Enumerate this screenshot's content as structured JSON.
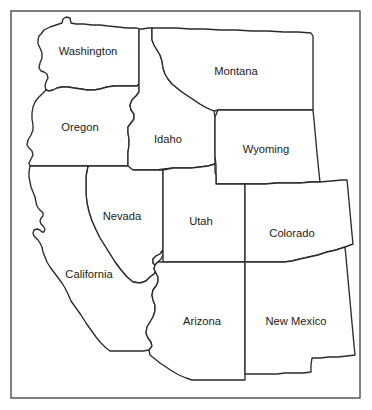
{
  "map": {
    "title": "Western United States outline map",
    "background_color": "#ffffff",
    "frame": {
      "name": "map-border-frame",
      "x": 11,
      "y": 11,
      "width": 349,
      "height": 387,
      "stroke_color": "#4a4a4a",
      "stroke_width": 1.4
    },
    "style": {
      "state_fill": "#ffffff",
      "state_stroke": "#2b2b2b",
      "state_stroke_width": 1.35,
      "label_color": "#1a1a1a",
      "label_font_size": 11.2
    },
    "states": [
      {
        "id": "washington",
        "label": "Washington",
        "label_x": 88,
        "label_y": 52,
        "path": "M 41 34 L 44 30 L 50 27 L 56 25 L 62 23 L 63 19 L 66 17 L 70 18 L 71 23 L 76 24 L 84 24 L 92 25 L 100 25 L 108 26 L 118 27 L 127 28 L 137 28 L 139 29 L 139 38 L 139 52 L 139 64 L 139 76 L 139 84 L 137 86 L 130 86 L 122 86 L 114 86 L 107 87 L 100 89 L 94 90 L 87 90 L 81 89 L 74 88 L 68 87 L 62 87 L 57 88 L 53 90 L 49 91 L 46 90 L 45 86 L 46 82 L 48 78 L 47 74 L 44 72 L 41 71 L 39 68 L 40 63 L 42 58 L 42 53 L 40 48 L 38 44 L 38 40 L 39 36 Z"
      },
      {
        "id": "oregon",
        "label": "Oregon",
        "label_x": 80,
        "label_y": 128,
        "path": "M 46 90 L 49 91 L 53 90 L 57 88 L 62 87 L 68 87 L 74 88 L 81 89 L 87 90 L 94 90 L 100 89 L 107 87 L 114 86 L 122 86 L 130 86 L 137 86 L 139 84 L 139 92 L 136 96 L 132 100 L 130 105 L 131 110 L 134 114 L 134 119 L 131 123 L 128 127 L 128 133 L 129 139 L 129 145 L 128 152 L 128 160 L 128 166 L 119 166 L 108 166 L 96 166 L 84 166 L 72 166 L 60 166 L 48 166 L 37 166 L 30 166 L 29 163 L 31 159 L 33 155 L 32 151 L 29 148 L 27 145 L 28 140 L 31 135 L 33 130 L 33 125 L 32 119 L 32 113 L 33 107 L 35 102 L 38 98 L 41 95 L 44 92 Z"
      },
      {
        "id": "idaho",
        "label": "Idaho",
        "label_x": 168,
        "label_y": 140,
        "path": "M 143 29 L 148 28 L 152 28 L 152 34 L 152 40 L 154 45 L 157 50 L 160 55 L 162 61 L 163 68 L 165 74 L 168 79 L 172 84 L 177 88 L 182 92 L 188 96 L 194 100 L 200 104 L 207 108 L 214 111 L 215 117 L 215 126 L 215 136 L 215 146 L 215 156 L 215 164 L 208 166 L 200 167 L 191 168 L 182 168 L 173 168 L 164 169 L 156 170 L 148 170 L 140 170 L 133 170 L 128 170 L 128 166 L 128 160 L 128 152 L 129 145 L 129 139 L 128 133 L 128 127 L 131 123 L 134 119 L 134 114 L 131 110 L 130 105 L 132 100 L 136 96 L 139 92 L 139 84 L 139 76 L 139 64 L 139 52 L 139 38 L 139 29 Z"
      },
      {
        "id": "montana",
        "label": "Montana",
        "label_x": 236,
        "label_y": 72,
        "path": "M 152 28 L 163 28 L 176 28 L 190 29 L 205 29 L 220 30 L 236 30 L 252 31 L 268 31 L 284 32 L 298 32 L 311 33 L 313 36 L 313 46 L 313 58 L 313 70 L 313 82 L 313 92 L 313 102 L 313 110 L 303 110 L 291 110 L 278 110 L 265 110 L 253 110 L 242 110 L 232 110 L 224 110 L 218 110 L 214 111 L 207 108 L 200 104 L 194 100 L 188 96 L 182 92 L 177 88 L 172 84 L 168 79 L 165 74 L 163 68 L 162 61 L 160 55 L 157 50 L 154 45 L 152 40 L 152 34 Z"
      },
      {
        "id": "wyoming",
        "label": "Wyoming",
        "label_x": 266,
        "label_y": 150,
        "path": "M 218 110 L 224 110 L 232 110 L 242 110 L 253 110 L 265 110 L 278 110 L 291 110 L 303 110 L 313 110 L 314 120 L 315 131 L 316 142 L 317 153 L 318 163 L 319 173 L 320 182 L 311 182 L 300 183 L 289 183 L 277 183 L 265 184 L 253 184 L 242 184 L 232 184 L 223 184 L 216 184 L 216 175 L 216 165 L 215 156 L 215 146 L 215 136 L 215 126 L 215 117 Z"
      },
      {
        "id": "nevada",
        "label": "Nevada",
        "label_x": 122,
        "label_y": 217,
        "path": "M 88 166 L 96 166 L 108 166 L 119 166 L 128 166 L 133 170 L 140 170 L 148 170 L 156 170 L 163 170 L 163 180 L 163 191 L 163 202 L 163 213 L 163 224 L 163 235 L 163 243 L 163 250 L 160 254 L 156 256 L 153 259 L 153 263 L 156 266 L 157 270 L 154 274 L 150 277 L 146 281 L 140 283 L 133 282 L 127 277 L 121 270 L 115 262 L 110 254 L 105 246 L 100 238 L 96 230 L 92 221 L 89 212 L 87 203 L 86 194 L 86 185 L 86 176 Z"
      },
      {
        "id": "california",
        "label": "California",
        "label_x": 89,
        "label_y": 275,
        "path": "M 30 166 L 37 166 L 48 166 L 60 166 L 72 166 L 84 166 L 88 166 L 86 176 L 86 185 L 86 194 L 87 203 L 89 212 L 92 221 L 96 230 L 100 238 L 105 246 L 110 254 L 115 262 L 121 270 L 127 277 L 133 282 L 140 283 L 146 281 L 150 277 L 154 274 L 157 270 L 156 266 L 153 263 L 153 259 L 156 256 L 160 254 L 163 250 L 163 255 L 161 259 L 158 262 L 155 265 L 154 269 L 156 273 L 158 277 L 158 282 L 156 286 L 153 290 L 152 295 L 153 300 L 155 305 L 155 311 L 153 317 L 150 322 L 147 327 L 146 333 L 148 338 L 151 342 L 152 346 L 149 350 L 143 351 L 135 351 L 126 351 L 117 351 L 110 351 L 106 348 L 101 343 L 96 337 L 91 330 L 86 323 L 81 315 L 76 308 L 71 301 L 68 294 L 65 288 L 62 283 L 59 279 L 56 275 L 53 271 L 50 267 L 47 262 L 45 257 L 43 252 L 42 247 L 40 243 L 38 240 L 36 238 L 34 236 L 33 233 L 34 230 L 37 229 L 40 230 L 42 232 L 44 232 L 45 229 L 43 226 L 41 224 L 40 221 L 41 218 L 43 216 L 43 213 L 41 211 L 39 209 L 37 206 L 36 202 L 35 197 L 33 192 L 31 187 L 30 182 L 29 177 L 29 172 Z"
      },
      {
        "id": "utah",
        "label": "Utah",
        "label_x": 201,
        "label_y": 222,
        "path": "M 163 170 L 173 168 L 182 168 L 191 168 L 200 167 L 208 166 L 215 164 L 215 172 L 216 175 L 216 184 L 223 184 L 232 184 L 242 184 L 245 184 L 245 195 L 245 206 L 245 217 L 245 228 L 245 239 L 245 250 L 245 262 L 235 262 L 224 262 L 213 262 L 202 262 L 191 262 L 180 262 L 171 262 L 163 262 L 163 253 L 163 243 L 163 235 L 163 224 L 163 213 L 163 202 L 163 191 L 163 180 Z"
      },
      {
        "id": "colorado",
        "label": "Colorado",
        "label_x": 292,
        "label_y": 234,
        "path": "M 245 184 L 253 184 L 265 184 L 277 183 L 289 183 L 300 183 L 311 182 L 320 182 L 331 181 L 342 180 L 347 180 L 348 190 L 349 201 L 350 212 L 351 223 L 352 234 L 353 244 L 345 247 L 336 250 L 327 252 L 318 255 L 309 257 L 300 259 L 292 261 L 284 262 L 275 262 L 266 262 L 257 262 L 250 262 L 245 262 L 245 250 L 245 239 L 245 228 L 245 217 L 245 206 L 245 195 Z"
      },
      {
        "id": "arizona",
        "label": "Arizona",
        "label_x": 202,
        "label_y": 322,
        "path": "M 163 262 L 171 262 L 180 262 L 191 262 L 202 262 L 213 262 L 224 262 L 235 262 L 245 262 L 245 273 L 245 285 L 245 297 L 245 309 L 245 321 L 245 333 L 245 345 L 245 357 L 245 369 L 245 380 L 236 380 L 226 380 L 216 380 L 207 380 L 199 380 L 192 380 L 186 378 L 179 375 L 172 371 L 166 367 L 160 363 L 155 359 L 150 355 L 149 350 L 152 346 L 151 342 L 148 338 L 146 333 L 147 327 L 150 322 L 153 317 L 155 311 L 155 305 L 153 300 L 152 295 L 153 290 L 156 286 L 158 282 L 158 277 L 156 273 L 154 269 L 155 265 L 158 262 Z"
      },
      {
        "id": "new-mexico",
        "label": "New Mexico",
        "label_x": 296,
        "label_y": 322,
        "path": "M 245 262 L 250 262 L 257 262 L 266 262 L 275 262 L 284 262 L 292 261 L 300 259 L 309 257 L 318 255 L 327 252 L 336 250 L 345 247 L 346 257 L 347 268 L 348 279 L 349 290 L 350 301 L 351 312 L 352 323 L 353 334 L 354 345 L 355 355 L 347 356 L 338 357 L 329 357 L 320 358 L 312 358 L 311 365 L 311 372 L 303 373 L 294 373 L 285 373 L 277 374 L 268 374 L 260 374 L 252 374 L 245 374 L 245 369 L 245 357 L 245 345 L 245 333 L 245 321 L 245 309 L 245 297 L 245 285 L 245 273 Z"
      }
    ]
  }
}
